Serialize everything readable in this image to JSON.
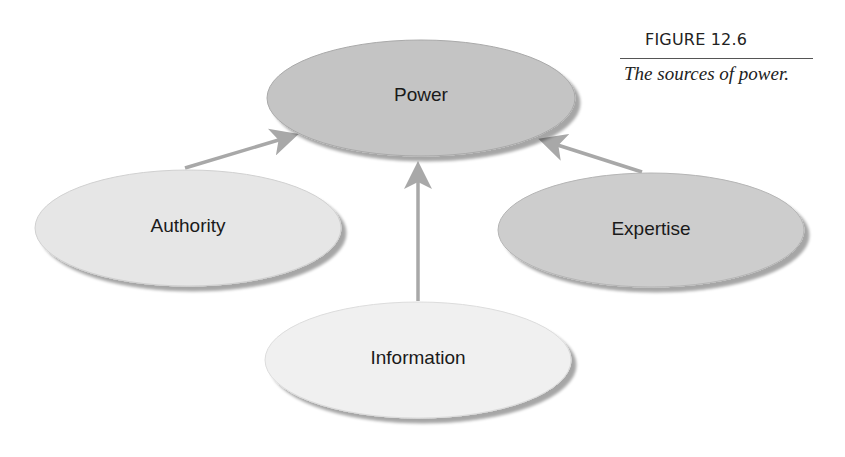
{
  "figure": {
    "number": "FIGURE 12.6",
    "caption": "The sources of power."
  },
  "diagram": {
    "central_node": {
      "label": "Power",
      "fill": "#c4c4c4"
    },
    "source_nodes": [
      {
        "label": "Authority",
        "fill": "#e6e6e6"
      },
      {
        "label": "Information",
        "fill": "#f0f0f0"
      },
      {
        "label": "Expertise",
        "fill": "#cdcdcd"
      }
    ],
    "arrow_color": "#a8a8a8",
    "edges": [
      {
        "from": "Authority",
        "to": "Power"
      },
      {
        "from": "Information",
        "to": "Power"
      },
      {
        "from": "Expertise",
        "to": "Power"
      }
    ]
  }
}
